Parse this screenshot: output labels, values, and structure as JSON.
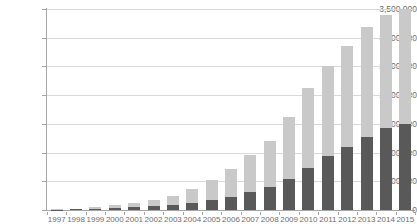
{
  "chart_data": {
    "type": "bar",
    "title": "",
    "xlabel": "",
    "ylabel": "",
    "stacked": true,
    "grid": true,
    "legend_position": "none",
    "ylim": [
      0,
      3500000
    ],
    "ytick_labels": [
      "3,500,000",
      "3,000,000",
      "2,500,000",
      "2,000,000",
      "1,500,000",
      "1,000,000",
      "500,000",
      "0"
    ],
    "ytick_values": [
      3500000,
      3000000,
      2500000,
      2000000,
      1500000,
      1000000,
      500000,
      0
    ],
    "categories": [
      "1997",
      "1998",
      "1999",
      "2000",
      "2001",
      "2002",
      "2003",
      "2004",
      "2005",
      "2006",
      "2007",
      "2008",
      "2009",
      "2010",
      "2011",
      "2012",
      "2013",
      "2014",
      "2015"
    ],
    "series": [
      {
        "name": "lower-segment",
        "color": "#595959",
        "values": [
          5000,
          10000,
          20000,
          35000,
          50000,
          70000,
          95000,
          130000,
          175000,
          235000,
          310000,
          400000,
          540000,
          730000,
          935000,
          1100000,
          1270000,
          1430000,
          1505000
        ]
      },
      {
        "name": "upper-segment",
        "color": "#c9c9c9",
        "values": [
          5000,
          12000,
          25000,
          45000,
          70000,
          105000,
          155000,
          230000,
          345000,
          485000,
          640000,
          800000,
          1080000,
          1400000,
          1570000,
          1760000,
          1910000,
          1970000,
          1995000
        ]
      }
    ],
    "totals": [
      10000,
      22000,
      45000,
      80000,
      120000,
      175000,
      250000,
      360000,
      520000,
      720000,
      950000,
      1200000,
      1620000,
      2130000,
      2505000,
      2860000,
      3180000,
      3400000,
      3500000
    ]
  }
}
